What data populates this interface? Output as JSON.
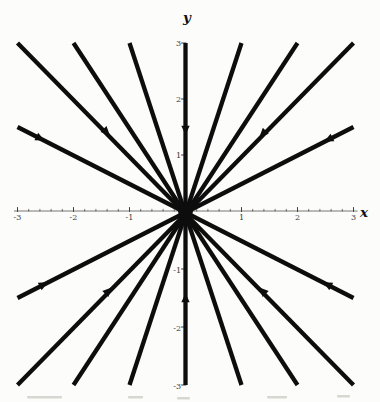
{
  "figure": {
    "background": "#fcfcfa",
    "ink_color": "#0d0d0d",
    "axis_color": "#6a6a6a",
    "tick_color": "#3f3f3f",
    "tick_label_color": "#3a3a3a",
    "scan_artifacts": [
      {
        "x": 27,
        "y": 396,
        "w": 35,
        "h": 2.5
      },
      {
        "x": 128,
        "y": 396,
        "w": 15,
        "h": 2.5
      },
      {
        "x": 177,
        "y": 397,
        "w": 13,
        "h": 2.5
      },
      {
        "x": 267,
        "y": 396,
        "w": 20,
        "h": 2.5
      },
      {
        "x": 337,
        "y": 395,
        "w": 13,
        "h": 2.5
      }
    ]
  },
  "chart_data": {
    "type": "line",
    "title": "",
    "xlabel": "x",
    "ylabel": "y",
    "xlim": [
      -3,
      3
    ],
    "ylim": [
      -3,
      3
    ],
    "grid": false,
    "legend": "none",
    "x_ticks": [
      {
        "value": -3,
        "label": "-3"
      },
      {
        "value": -2,
        "label": "-2"
      },
      {
        "value": -1,
        "label": "-1"
      },
      {
        "value": 1,
        "label": "1"
      },
      {
        "value": 2,
        "label": "2"
      },
      {
        "value": 3,
        "label": "3"
      }
    ],
    "y_ticks": [
      {
        "value": 3,
        "label": "3"
      },
      {
        "value": 2,
        "label": "2"
      },
      {
        "value": 1,
        "label": "1"
      },
      {
        "value": -1,
        "label": "-1"
      },
      {
        "value": -2,
        "label": "-2"
      },
      {
        "value": -3,
        "label": "-3"
      }
    ],
    "minor_tick_step": 0.2,
    "series": [
      {
        "name": "x = 0 (vertical trajectory)",
        "x": [
          0,
          0
        ],
        "y": [
          -3,
          3
        ]
      },
      {
        "name": "y = 3x",
        "x": [
          -1,
          1
        ],
        "y": [
          -3,
          3
        ]
      },
      {
        "name": "y = -3x",
        "x": [
          -1,
          1
        ],
        "y": [
          3,
          -3
        ]
      },
      {
        "name": "y = 1.5x",
        "x": [
          -2,
          2
        ],
        "y": [
          -3,
          3
        ]
      },
      {
        "name": "y = -1.5x",
        "x": [
          -2,
          2
        ],
        "y": [
          3,
          -3
        ]
      },
      {
        "name": "y = x",
        "x": [
          -3,
          3
        ],
        "y": [
          -3,
          3
        ]
      },
      {
        "name": "y = -x",
        "x": [
          -3,
          3
        ],
        "y": [
          3,
          -3
        ]
      },
      {
        "name": "y = x/2",
        "x": [
          -3,
          3
        ],
        "y": [
          -1.5,
          1.5
        ]
      },
      {
        "name": "y = -x/2",
        "x": [
          -3,
          3
        ],
        "y": [
          1.5,
          -1.5
        ]
      }
    ],
    "arrows_toward_origin": [
      {
        "tip": [
          0,
          1.36
        ]
      },
      {
        "tip": [
          0,
          -1.42
        ]
      },
      {
        "tip": [
          1.32,
          1.32
        ]
      },
      {
        "tip": [
          -1.32,
          -1.32
        ]
      },
      {
        "tip": [
          -1.35,
          1.35
        ]
      },
      {
        "tip": [
          1.32,
          -1.32
        ]
      },
      {
        "tip": [
          2.48,
          1.24
        ]
      },
      {
        "tip": [
          -2.46,
          -1.23
        ]
      },
      {
        "tip": [
          -2.52,
          1.26
        ]
      },
      {
        "tip": [
          2.46,
          -1.23
        ]
      }
    ]
  }
}
